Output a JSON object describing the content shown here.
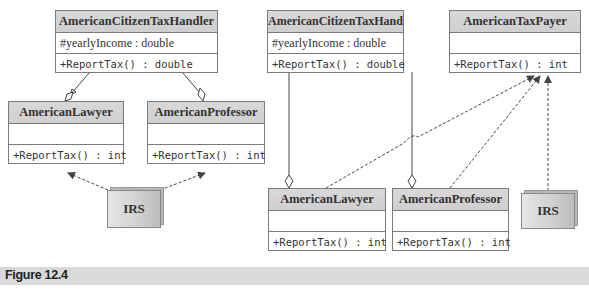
{
  "diagram_left": {
    "handler": {
      "name": "AmericanCitizenTaxHandler",
      "attribute": "#yearlyIncome : double",
      "operation": "+ReportTax() : double"
    },
    "lawyer": {
      "name": "AmericanLawyer",
      "attribute": "",
      "operation": "+ReportTax() : int"
    },
    "professor": {
      "name": "AmericanProfessor",
      "attribute": "",
      "operation": "+ReportTax() : int"
    },
    "irs": {
      "name": "IRS"
    }
  },
  "diagram_right": {
    "handler": {
      "name": "AmericanCitizenTaxHandler",
      "attribute": "#yearlyIncome : double",
      "operation": "+ReportTax() : double"
    },
    "taxpayer": {
      "name": "AmericanTaxPayer",
      "attribute": "",
      "operation": "+ReportTax() : int"
    },
    "lawyer": {
      "name": "AmericanLawyer",
      "attribute": "",
      "operation": "+ReportTax() : int"
    },
    "professor": {
      "name": "AmericanProfessor",
      "attribute": "",
      "operation": "+ReportTax() : int"
    },
    "irs": {
      "name": "IRS"
    }
  },
  "caption": {
    "label": "Figure 12.4"
  },
  "colors": {
    "header_fill": "#d3d3d3",
    "border": "#7a7a7a",
    "caption_bar": "#d9d9d9",
    "line": "#444444"
  }
}
